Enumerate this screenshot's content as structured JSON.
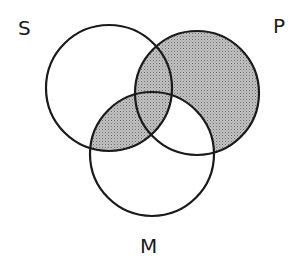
{
  "diagram": {
    "type": "venn-3",
    "labels": {
      "s": "S",
      "p": "P",
      "m": "M"
    },
    "shaded_regions": [
      "P only",
      "S∩P not M",
      "S∩P∩M",
      "S∩M not P"
    ],
    "unshaded_regions": [
      "S only",
      "M only",
      "M∩P not S"
    ],
    "colors": {
      "stroke": "#1a1a1a",
      "shade": "#b8b8b8",
      "background": "#ffffff"
    }
  }
}
